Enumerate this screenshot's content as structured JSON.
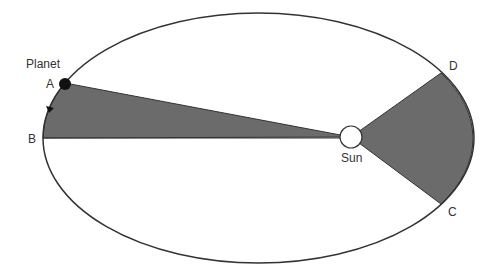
{
  "diagram": {
    "labels": {
      "planet": "Planet",
      "a": "A",
      "b": "B",
      "c": "C",
      "d": "D",
      "sun": "Sun"
    },
    "colors": {
      "sector_fill": "#6b6b6b",
      "outline": "#333333",
      "planet": "#111111",
      "sun_fill": "#ffffff"
    }
  }
}
